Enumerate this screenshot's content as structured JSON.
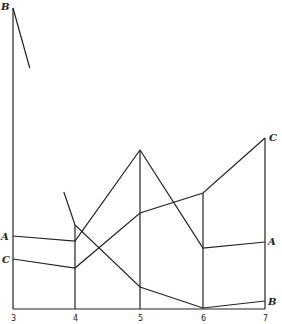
{
  "chart_data": {
    "type": "line",
    "title": "",
    "xlabel": "",
    "ylabel": "",
    "categories": [
      3,
      4,
      5,
      6,
      7
    ],
    "x_tick_labels": [
      "3",
      "4",
      "5",
      "6",
      "7"
    ],
    "ylim": [
      0,
      301
    ],
    "grid": "vertical lines at each x category",
    "legend": "inline end labels",
    "series": [
      {
        "name": "A",
        "x": [
          3,
          4,
          5,
          6,
          7
        ],
        "values": [
          73,
          68,
          159,
          61,
          67
        ],
        "label_ends": [
          "left",
          "right"
        ]
      },
      {
        "name": "C",
        "x": [
          3,
          4,
          5,
          6,
          7
        ],
        "values": [
          50,
          41,
          96,
          116,
          171
        ],
        "label_ends": [
          "left",
          "right"
        ]
      },
      {
        "name": "B",
        "segments": [
          {
            "x": [
              3,
              3.27
            ],
            "values": [
              301,
              241
            ]
          },
          {
            "x": [
              3.82,
              4,
              5,
              6,
              7
            ],
            "values": [
              117,
              84,
              22,
              1,
              8
            ]
          }
        ],
        "label_ends": [
          "left-top",
          "right"
        ]
      }
    ]
  },
  "labels": {
    "A": "A",
    "B": "B",
    "C": "C"
  }
}
